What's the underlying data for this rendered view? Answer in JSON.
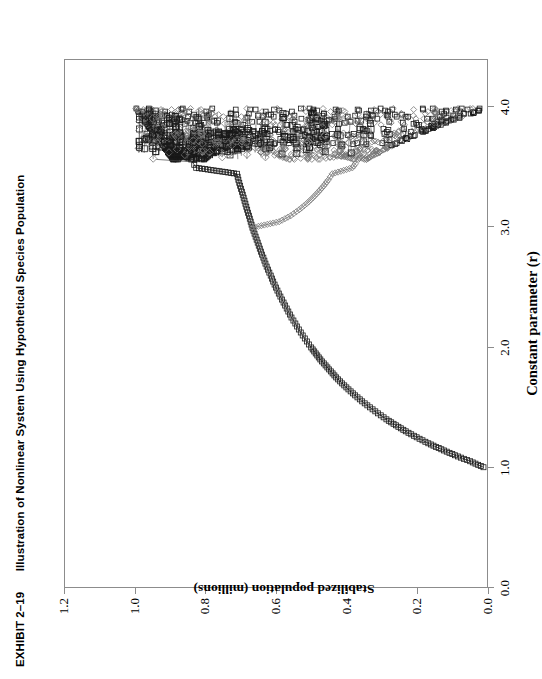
{
  "exhibit": {
    "number": "EXHIBIT 2–19",
    "title": "Illustration of Nonlinear System Using Hypothetical Species Population"
  },
  "colors": {
    "frame": "#8c8c8c",
    "series_squares": "#1a1a1a",
    "series_diamonds": "#777777",
    "connector": "#444444",
    "background": "#ffffff"
  },
  "chart_data": {
    "type": "line",
    "title": "Illustration of Nonlinear System Using Hypothetical Species Population",
    "xlabel": "Constant parameter (r)",
    "ylabel": "Stabilized population (millions)",
    "xlim": [
      0.0,
      4.4
    ],
    "ylim": [
      0.0,
      1.2
    ],
    "xticks": [
      "0.0",
      "1.0",
      "2.0",
      "3.0",
      "4.0"
    ],
    "xtick_values": [
      0.0,
      1.0,
      2.0,
      3.0,
      4.0
    ],
    "yticks": [
      "0.0",
      "0.2",
      "0.4",
      "0.6",
      "0.8",
      "1.0",
      "1.2"
    ],
    "ytick_values": [
      0.0,
      0.2,
      0.4,
      0.6,
      0.8,
      1.0,
      1.2
    ],
    "grid": false,
    "legend": "none",
    "markers": [
      "square",
      "diamond"
    ],
    "series": [
      {
        "name": "attractor-branch-squares",
        "marker": "square",
        "x": [
          1.0,
          1.05,
          1.1,
          1.15,
          1.2,
          1.25,
          1.3,
          1.35,
          1.4,
          1.45,
          1.5,
          1.55,
          1.6,
          1.65,
          1.7,
          1.75,
          1.8,
          1.85,
          1.9,
          1.95,
          2.0,
          2.05,
          2.1,
          2.15,
          2.2,
          2.25,
          2.3,
          2.35,
          2.4,
          2.45,
          2.5,
          2.55,
          2.6,
          2.65,
          2.7,
          2.75,
          2.8,
          2.85,
          2.9,
          2.95,
          3.0,
          3.05,
          3.1,
          3.15,
          3.2,
          3.25,
          3.3,
          3.35,
          3.4,
          3.45,
          3.5,
          3.55
        ],
        "y": [
          0.01,
          0.048,
          0.091,
          0.13,
          0.167,
          0.2,
          0.231,
          0.259,
          0.286,
          0.31,
          0.333,
          0.355,
          0.375,
          0.394,
          0.412,
          0.429,
          0.444,
          0.459,
          0.474,
          0.487,
          0.5,
          0.512,
          0.524,
          0.535,
          0.545,
          0.556,
          0.565,
          0.574,
          0.583,
          0.592,
          0.6,
          0.608,
          0.615,
          0.623,
          0.63,
          0.636,
          0.643,
          0.649,
          0.655,
          0.661,
          0.667,
          0.672,
          0.677,
          0.682,
          0.687,
          0.692,
          0.697,
          0.702,
          0.707,
          0.711,
          0.827,
          0.838
        ]
      },
      {
        "name": "attractor-branch-diamonds",
        "marker": "diamond",
        "x": [
          3.0,
          3.05,
          3.1,
          3.15,
          3.2,
          3.25,
          3.3,
          3.35,
          3.4,
          3.45,
          3.5,
          3.55
        ],
        "y": [
          0.667,
          0.591,
          0.558,
          0.534,
          0.513,
          0.495,
          0.479,
          0.464,
          0.451,
          0.44,
          0.383,
          0.37
        ]
      }
    ],
    "chaos_region": {
      "x_start": 3.57,
      "x_end": 4.0,
      "y_min": 0.32,
      "y_max": 1.0,
      "note": "dense band of square and diamond markers joined by long horizontal connector lines"
    }
  },
  "axes": {
    "x_title": "Constant parameter (r)",
    "y_title": "Stabilized population (millions)"
  }
}
